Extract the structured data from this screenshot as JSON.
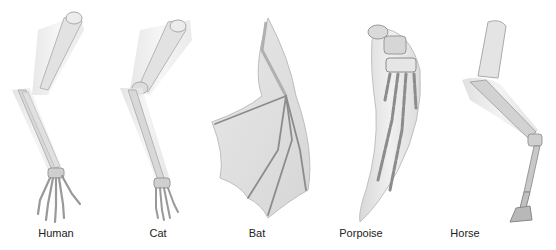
{
  "figure": {
    "limbs": [
      {
        "id": "human",
        "label": "Human",
        "label_x": 56
      },
      {
        "id": "cat",
        "label": "Cat",
        "label_x": 158
      },
      {
        "id": "bat",
        "label": "Bat",
        "label_x": 257
      },
      {
        "id": "porpoise",
        "label": "Porpoise",
        "label_x": 361
      },
      {
        "id": "horse",
        "label": "Horse",
        "label_x": 465
      }
    ]
  },
  "colors": {
    "background": "#ffffff",
    "flesh": "#e6e6e6",
    "flesh_stroke": "#c8c8c8",
    "bone": "#d4d4d4",
    "bone_stroke": "#9a9a9a",
    "dark_bone": "#8c8c8c",
    "label": "#222222"
  }
}
